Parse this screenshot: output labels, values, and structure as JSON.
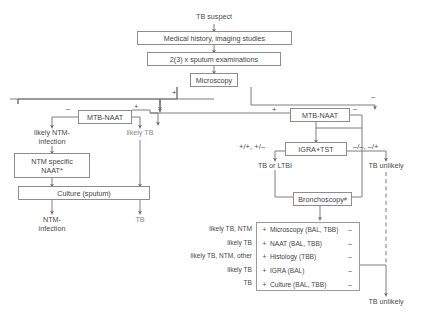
{
  "nodes": {
    "tb_suspect": "TB suspect",
    "medical_history": "Medical history, imaging studies",
    "sputum_exams": "2(3) x sputum examinations",
    "microscopy": "Microscopy",
    "mtb_naat_left": "MTB-NAAT",
    "mtb_naat_right": "MTB-NAAT",
    "likely_ntm_infection": "likely NTM-\ninfection",
    "likely_tb_mid": "likely TB",
    "ntm_specific_naat": "NTM specific\nNAAT*",
    "culture_sputum": "Culture (sputum)",
    "ntm_infection": "NTM-\ninfection",
    "tb_left": "TB",
    "igra_tst": "IGRA+TST",
    "tb_or_ltbi": "TB or LTBI",
    "tb_unlikely_upper": "TB unlikely",
    "bronchoscopy": "Bronchoscopy",
    "bronchoscopy_sup": "#",
    "tb_unlikely_lower": "TB unlikely"
  },
  "signs": {
    "microscopy_positive": "+",
    "microscopy_negative": "–",
    "mtb_left_negative": "–",
    "mtb_left_positive": "+",
    "mtb_right_incoming_positive": "+",
    "mtb_right_negative": "–",
    "igra_positive_combo": "+/+,  +/–",
    "igra_negative_combo": "–/–,  –/+"
  },
  "results_table": {
    "columns": [
      "result",
      "test",
      "specimen",
      "negative"
    ],
    "rows": [
      {
        "label": "likely TB, NTM",
        "plus": "+",
        "test": "Microscopy",
        "specimen": "(BAL, TBB)",
        "minus": "–"
      },
      {
        "label": "likely TB",
        "plus": "+",
        "test": "NAAT",
        "specimen": "(BAL, TBB)",
        "minus": "–"
      },
      {
        "label": "likely TB, NTM, other",
        "plus": "+",
        "test": "Histology",
        "specimen": "(TBB)",
        "minus": "–"
      },
      {
        "label": "likely TB",
        "plus": "+",
        "test": "IGRA",
        "specimen": "(BAL)",
        "minus": "–"
      },
      {
        "label": "TB",
        "plus": "+",
        "test": "Culture",
        "specimen": "(BAL, TBB)",
        "minus": "–"
      }
    ]
  },
  "colors": {
    "line": "#6f6f6f",
    "box_border": "#8d8d8d",
    "text": "#3f3f3f",
    "faint_text": "#8a8a8a",
    "background": "#ffffff"
  }
}
